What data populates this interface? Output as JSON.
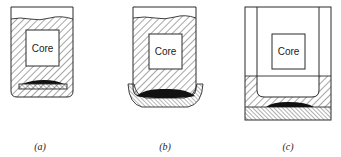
{
  "figure": {
    "colors": {
      "stroke": "#2a2a2a",
      "hatch": "#3a3a3a",
      "fill_dark": "#111111",
      "background": "#ffffff"
    },
    "panels": [
      {
        "id": "a",
        "caption": "(a)",
        "core_label": "Core",
        "parts": [
          "container",
          "sand-fill",
          "core",
          "chill-plate",
          "dark-deposit"
        ]
      },
      {
        "id": "b",
        "caption": "(b)",
        "core_label": "Core",
        "parts": [
          "container",
          "sand-fill",
          "core",
          "curved-dish",
          "dark-deposit"
        ]
      },
      {
        "id": "c",
        "caption": "(c)",
        "core_label": "Core",
        "parts": [
          "outer-frame",
          "inner-u-liner",
          "core",
          "hatched-layer",
          "fine-hatched-base",
          "dark-deposit"
        ]
      }
    ]
  }
}
